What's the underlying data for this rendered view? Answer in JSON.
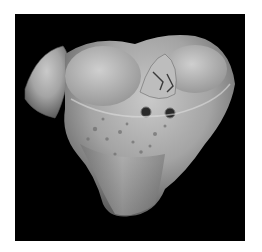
{
  "image": {
    "subject": "3D surface rendering of a tibial plateau (proximal tibia) bone",
    "background_color": "#000000",
    "frame_color": "#ffffff",
    "bone_color": "#a8a8a8",
    "features": [
      "two concave articular condyle surfaces",
      "intercondylar eminence with small metallic implant/wire",
      "two small drill holes on anterior surface",
      "porous cortical texture on front face",
      "fibular head fragment on left side"
    ]
  }
}
